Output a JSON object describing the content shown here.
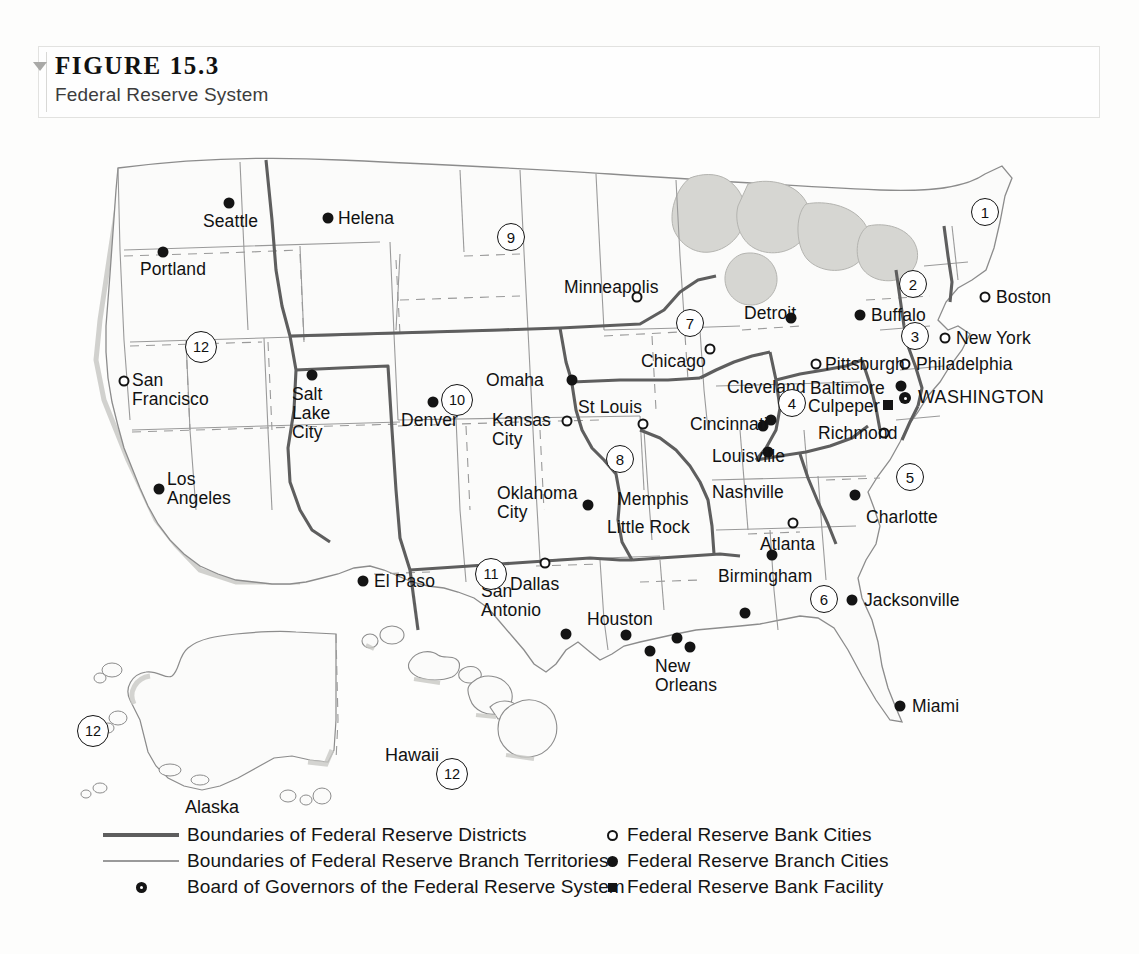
{
  "figure": {
    "number": "FIGURE 15.3",
    "subtitle": "Federal Reserve System"
  },
  "legend": {
    "left": [
      {
        "key": "thick-line",
        "label": "Boundaries of Federal Reserve Districts"
      },
      {
        "key": "thin-line",
        "label": "Boundaries of Federal Reserve Branch Territories"
      },
      {
        "key": "board-marker",
        "label": "Board of Governors of the Federal Reserve System"
      }
    ],
    "right": [
      {
        "key": "open-circle",
        "label": "Federal Reserve Bank Cities"
      },
      {
        "key": "filled-circle",
        "label": "Federal Reserve Branch Cities"
      },
      {
        "key": "filled-square",
        "label": "Federal Reserve Bank Facility"
      }
    ]
  },
  "map": {
    "districts": [
      {
        "number": "1",
        "x": 985,
        "y": 82
      },
      {
        "number": "2",
        "x": 913,
        "y": 154
      },
      {
        "number": "3",
        "x": 915,
        "y": 206
      },
      {
        "number": "4",
        "x": 792,
        "y": 273
      },
      {
        "number": "5",
        "x": 910,
        "y": 347
      },
      {
        "number": "6",
        "x": 824,
        "y": 469
      },
      {
        "number": "7",
        "x": 690,
        "y": 193
      },
      {
        "number": "8",
        "x": 620,
        "y": 329
      },
      {
        "number": "9",
        "x": 511,
        "y": 107
      },
      {
        "number": "10",
        "x": 457,
        "y": 270
      },
      {
        "number": "11",
        "x": 491,
        "y": 444
      },
      {
        "number": "12",
        "x": 201,
        "y": 217
      },
      {
        "number": "12",
        "x": 93,
        "y": 601
      },
      {
        "number": "12",
        "x": 452,
        "y": 644
      }
    ],
    "insets": [
      {
        "name": "Alaska",
        "x": 212,
        "y": 667
      },
      {
        "name": "Hawaii",
        "x": 412,
        "y": 615
      }
    ],
    "cities": [
      {
        "name": "Seattle",
        "type": "branch",
        "mx": 229,
        "my": 73,
        "lx": 203,
        "ly": 82,
        "align": "l"
      },
      {
        "name": "Portland",
        "type": "branch",
        "mx": 163,
        "my": 122,
        "lx": 140,
        "ly": 130,
        "align": "l"
      },
      {
        "name": "Helena",
        "type": "branch",
        "mx": 328,
        "my": 88,
        "lx": 338,
        "ly": 79,
        "align": "l"
      },
      {
        "name": "San\nFrancisco",
        "type": "bank",
        "mx": 124,
        "my": 251,
        "lx": 132,
        "ly": 241,
        "align": "l"
      },
      {
        "name": "Salt\nLake\nCity",
        "type": "branch",
        "mx": 312,
        "my": 245,
        "lx": 292,
        "ly": 255,
        "align": "l"
      },
      {
        "name": "Los\nAngeles",
        "type": "branch",
        "mx": 159,
        "my": 359,
        "lx": 167,
        "ly": 340,
        "align": "l"
      },
      {
        "name": "Denver",
        "type": "branch",
        "mx": 433,
        "my": 272,
        "lx": 401,
        "ly": 281,
        "align": "l"
      },
      {
        "name": "El Paso",
        "type": "branch",
        "mx": 363,
        "my": 451,
        "lx": 374,
        "ly": 442,
        "align": "l"
      },
      {
        "name": "Minneapolis",
        "type": "bank",
        "mx": 637,
        "my": 167,
        "lx": 564,
        "ly": 148,
        "align": "l"
      },
      {
        "name": "Omaha",
        "type": "branch",
        "mx": 572,
        "my": 250,
        "lx": 486,
        "ly": 241,
        "align": "l"
      },
      {
        "name": "Kansas\nCity",
        "type": "bank",
        "mx": 567,
        "my": 291,
        "lx": 492,
        "ly": 281,
        "align": "l"
      },
      {
        "name": "St Louis",
        "type": "bank",
        "mx": 643,
        "my": 294,
        "lx": 578,
        "ly": 268,
        "align": "l"
      },
      {
        "name": "Chicago",
        "type": "bank",
        "mx": 710,
        "my": 219,
        "lx": 641,
        "ly": 222,
        "align": "l"
      },
      {
        "name": "Detroit",
        "type": "branch",
        "mx": 791,
        "my": 188,
        "lx": 744,
        "ly": 174,
        "align": "l"
      },
      {
        "name": "Buffalo",
        "type": "branch",
        "mx": 860,
        "my": 185,
        "lx": 871,
        "ly": 176,
        "align": "l"
      },
      {
        "name": "Boston",
        "type": "bank",
        "mx": 985,
        "my": 167,
        "lx": 996,
        "ly": 158,
        "align": "l"
      },
      {
        "name": "New York",
        "type": "bank",
        "mx": 945,
        "my": 208,
        "lx": 956,
        "ly": 199,
        "align": "l"
      },
      {
        "name": "Philadelphia",
        "type": "bank",
        "mx": 905,
        "my": 234,
        "lx": 916,
        "ly": 225,
        "align": "l"
      },
      {
        "name": "Pittsburgh",
        "type": "bank",
        "mx": 816,
        "my": 234,
        "lx": 825,
        "ly": 225,
        "align": "l"
      },
      {
        "name": "Cleveland",
        "type": "branch",
        "mx": 771,
        "my": 290,
        "lx": 727,
        "ly": 248,
        "align": "l"
      },
      {
        "name": "Baltimore",
        "type": "branch",
        "mx": 901,
        "my": 256,
        "lx": 810,
        "ly": 249,
        "align": "l"
      },
      {
        "name": "Culpeper",
        "type": "facility",
        "mx": 888,
        "my": 275,
        "lx": 808,
        "ly": 267,
        "align": "l"
      },
      {
        "name": "WASHINGTON",
        "type": "board",
        "mx": 905,
        "my": 268,
        "lx": 918,
        "ly": 258,
        "align": "l"
      },
      {
        "name": "Richmond",
        "type": "bank",
        "mx": 884,
        "my": 303,
        "lx": 818,
        "ly": 294,
        "align": "l"
      },
      {
        "name": "Cincinnati",
        "type": "branch",
        "mx": 763,
        "my": 296,
        "lx": 690,
        "ly": 285,
        "align": "l"
      },
      {
        "name": "Louisville",
        "type": "branch",
        "mx": 768,
        "my": 322,
        "lx": 712,
        "ly": 317,
        "align": "l"
      },
      {
        "name": "Nashville",
        "type": "branch",
        "mx": 745,
        "my": 483,
        "lx": 712,
        "ly": 353,
        "align": "l"
      },
      {
        "name": "Charlotte",
        "type": "branch",
        "mx": 855,
        "my": 365,
        "lx": 866,
        "ly": 378,
        "align": "l"
      },
      {
        "name": "Atlanta",
        "type": "bank",
        "mx": 793,
        "my": 393,
        "lx": 760,
        "ly": 405,
        "align": "l"
      },
      {
        "name": "Oklahoma\nCity",
        "type": "branch",
        "mx": 588,
        "my": 375,
        "lx": 497,
        "ly": 354,
        "align": "l"
      },
      {
        "name": "Memphis",
        "type": "branch",
        "mx": 677,
        "my": 508,
        "lx": 617,
        "ly": 360,
        "align": "l"
      },
      {
        "name": "Little Rock",
        "type": "branch",
        "mx": 650,
        "my": 521,
        "lx": 607,
        "ly": 388,
        "align": "l"
      },
      {
        "name": "Birmingham",
        "type": "branch",
        "mx": 772,
        "my": 425,
        "lx": 718,
        "ly": 437,
        "align": "l"
      },
      {
        "name": "Dallas",
        "type": "bank",
        "mx": 545,
        "my": 433,
        "lx": 510,
        "ly": 445,
        "align": "l"
      },
      {
        "name": "San\nAntonio",
        "type": "branch",
        "mx": 566,
        "my": 504,
        "lx": 481,
        "ly": 452,
        "align": "l"
      },
      {
        "name": "Houston",
        "type": "branch",
        "mx": 626,
        "my": 505,
        "lx": 587,
        "ly": 480,
        "align": "l"
      },
      {
        "name": "New\nOrleans",
        "type": "branch",
        "mx": 690,
        "my": 517,
        "lx": 655,
        "ly": 527,
        "align": "l"
      },
      {
        "name": "Jacksonville",
        "type": "branch",
        "mx": 852,
        "my": 470,
        "lx": 864,
        "ly": 461,
        "align": "l"
      },
      {
        "name": "Miami",
        "type": "branch",
        "mx": 900,
        "my": 576,
        "lx": 912,
        "ly": 567,
        "align": "l"
      }
    ]
  },
  "colors": {
    "district_boundary": "#5e5e5e",
    "branch_boundary": "#9a9a9a",
    "state_outline": "#8c8c8c",
    "water": "#d6d6d2",
    "land": "#fbfbfa",
    "marker": "#141414"
  }
}
